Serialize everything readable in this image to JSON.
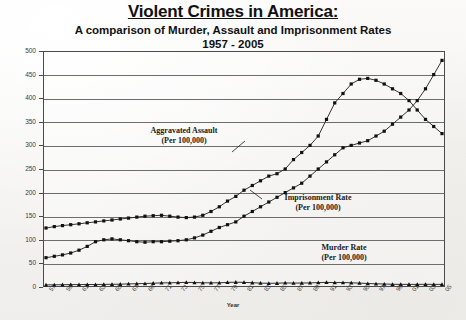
{
  "titles": {
    "main": "Violent Crimes in America:",
    "sub1": "A comparison of Murder, Assault and Imprisonment Rates",
    "sub2": "1957 - 2005"
  },
  "axis": {
    "x_title": "Year",
    "y_ticks": [
      "500",
      "450",
      "400",
      "350",
      "300",
      "250",
      "200",
      "150",
      "100",
      "50",
      "0"
    ],
    "x_ticks": [
      "57",
      "59",
      "61",
      "63",
      "65",
      "67",
      "69",
      "71",
      "73",
      "75",
      "77",
      "79",
      "81",
      "83",
      "85",
      "87",
      "89",
      "91",
      "93",
      "95",
      "97",
      "99",
      "01",
      "03",
      "05"
    ]
  },
  "annotations": {
    "assault": {
      "line1": "Aggravated Assault",
      "line2": "(Per 100,000)"
    },
    "imprisonment": {
      "line1": "Imprisonment Rate",
      "line2": "(Per 100,000)"
    },
    "murder": {
      "line1": "Murder Rate",
      "line2": "(Per 100,000)"
    }
  },
  "chart_data": {
    "type": "line",
    "title": "Violent Crimes in America:",
    "subtitle": "A comparison of Murder, Assault and Imprisonment Rates 1957 - 2005",
    "xlabel": "Year",
    "ylabel": "",
    "ylim": [
      0,
      500
    ],
    "xlim": [
      1957,
      2005
    ],
    "grid": true,
    "legend": "inline-annotations",
    "x": [
      1957,
      1958,
      1959,
      1960,
      1961,
      1962,
      1963,
      1964,
      1965,
      1966,
      1967,
      1968,
      1969,
      1970,
      1971,
      1972,
      1973,
      1974,
      1975,
      1976,
      1977,
      1978,
      1979,
      1980,
      1981,
      1982,
      1983,
      1984,
      1985,
      1986,
      1987,
      1988,
      1989,
      1990,
      1991,
      1992,
      1993,
      1994,
      1995,
      1996,
      1997,
      1998,
      1999,
      2000,
      2001,
      2002,
      2003,
      2004,
      2005
    ],
    "series": [
      {
        "name": "Aggravated Assault (Per 100,000)",
        "marker": "square",
        "values": [
          125,
          128,
          130,
          132,
          134,
          136,
          138,
          140,
          142,
          144,
          146,
          148,
          150,
          151,
          152,
          150,
          148,
          147,
          148,
          152,
          160,
          170,
          182,
          192,
          205,
          215,
          225,
          235,
          240,
          250,
          270,
          285,
          300,
          320,
          355,
          390,
          410,
          430,
          440,
          442,
          438,
          430,
          420,
          410,
          395,
          375,
          355,
          340,
          325
        ]
      },
      {
        "name": "Imprisonment Rate (Per 100,000)",
        "marker": "square",
        "values": [
          62,
          65,
          68,
          72,
          78,
          86,
          96,
          100,
          102,
          100,
          98,
          96,
          95,
          96,
          96,
          97,
          98,
          100,
          104,
          110,
          118,
          126,
          132,
          138,
          150,
          160,
          170,
          180,
          190,
          200,
          210,
          220,
          235,
          250,
          265,
          280,
          295,
          300,
          305,
          310,
          320,
          330,
          345,
          360,
          375,
          395,
          420,
          450,
          480
        ]
      },
      {
        "name": "Murder Rate (Per 100,000)",
        "marker": "triangle",
        "values": [
          4.5,
          4.6,
          4.8,
          5.0,
          5.1,
          5.2,
          5.4,
          5.6,
          5.8,
          6.0,
          6.5,
          7.0,
          7.4,
          8.0,
          8.6,
          9.0,
          9.4,
          9.8,
          9.6,
          9.0,
          8.8,
          9.0,
          9.7,
          10.2,
          9.8,
          9.1,
          8.3,
          7.9,
          8.0,
          8.6,
          8.3,
          8.4,
          8.7,
          9.4,
          9.8,
          9.3,
          9.5,
          9.0,
          8.2,
          7.4,
          6.8,
          6.3,
          5.7,
          5.5,
          5.6,
          5.6,
          5.7,
          5.5,
          5.6
        ]
      }
    ]
  }
}
